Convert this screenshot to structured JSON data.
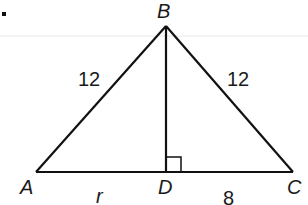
{
  "figure": {
    "bullet": ".",
    "vertices": {
      "A": "A",
      "B": "B",
      "C": "C",
      "D": "D"
    },
    "side_labels": {
      "AB": "12",
      "BC": "12",
      "AD": "r",
      "DC": "8"
    },
    "right_angle_at": "D",
    "colors": {
      "stroke": "#111111",
      "guide_line": "#e6e6e6"
    }
  }
}
